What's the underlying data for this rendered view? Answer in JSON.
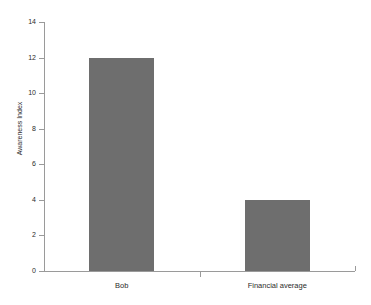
{
  "chart_data": {
    "type": "bar",
    "title": "",
    "xlabel": "",
    "ylabel": "Awareness Index",
    "categories": [
      "Bob",
      "Financial average"
    ],
    "values": [
      12,
      4
    ],
    "series": [
      {
        "name": "Awareness Index",
        "values": [
          12,
          4
        ]
      }
    ],
    "ylim": [
      0,
      14
    ],
    "ytick_labels": [
      "0",
      "2",
      "4",
      "6",
      "8",
      "10",
      "12",
      "14"
    ],
    "ytick_values": [
      0,
      2,
      4,
      6,
      8,
      10,
      12,
      14
    ],
    "grid": false,
    "legend": false,
    "bar_color": "#6e6e6e",
    "axis_color": "#9a9a9a",
    "background": "#ffffff"
  },
  "title_clipped": "· · · · ·"
}
